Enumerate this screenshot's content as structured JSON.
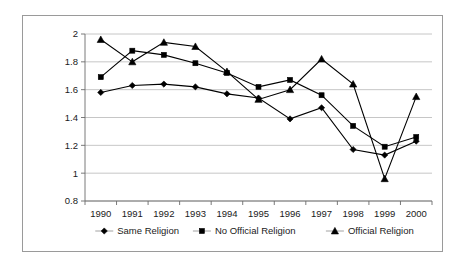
{
  "chart_data": {
    "type": "line",
    "title": "",
    "xlabel": "",
    "ylabel": "Mean Level of Protest",
    "x": [
      1990,
      1991,
      1992,
      1993,
      1994,
      1995,
      1996,
      1997,
      1998,
      1999,
      2000
    ],
    "categories": [
      "1990",
      "1991",
      "1992",
      "1993",
      "1994",
      "1995",
      "1996",
      "1997",
      "1998",
      "1999",
      "2000"
    ],
    "ylim": [
      0.8,
      2
    ],
    "yticks": [
      0.8,
      1,
      1.2,
      1.4,
      1.6,
      1.8,
      2
    ],
    "ytick_labels": [
      "0.8",
      "1",
      "1.2",
      "1.4",
      "1.6",
      "1.8",
      "2"
    ],
    "grid": true,
    "legend_position": "bottom",
    "series": [
      {
        "name": "Same Religion",
        "marker": "diamond",
        "color": "#000000",
        "values": [
          1.58,
          1.63,
          1.64,
          1.62,
          1.57,
          1.54,
          1.39,
          1.47,
          1.17,
          1.13,
          1.23
        ]
      },
      {
        "name": "No Official Religion",
        "marker": "square",
        "color": "#000000",
        "values": [
          1.69,
          1.88,
          1.85,
          1.79,
          1.72,
          1.62,
          1.67,
          1.56,
          1.34,
          1.19,
          1.26
        ]
      },
      {
        "name": "Official Religion",
        "marker": "triangle",
        "color": "#000000",
        "values": [
          1.96,
          1.8,
          1.94,
          1.91,
          1.73,
          1.53,
          1.6,
          1.82,
          1.64,
          0.96,
          1.55
        ]
      }
    ]
  },
  "axis": {
    "y_title": "Mean Level of Protest"
  },
  "legend": {
    "items": [
      {
        "label": "Same Religion",
        "marker": "diamond"
      },
      {
        "label": "No Official Religion",
        "marker": "square"
      },
      {
        "label": "Official Religion",
        "marker": "triangle"
      }
    ]
  }
}
